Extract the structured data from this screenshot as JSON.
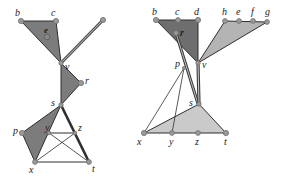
{
  "colors": {
    "dark_fill": "#7c7c7c",
    "light_fill": "#b4b4b4",
    "lighter_fill": "#cacaca",
    "edge": "#2e2e2e",
    "node": "#9a9a9a"
  },
  "left_diagram": {
    "labels": {
      "b": "b",
      "c": "c",
      "e": "e",
      "v": "v",
      "r": "r",
      "s": "s",
      "p": "p",
      "y": "y",
      "z": "z",
      "x": "x",
      "t": "t"
    }
  },
  "right_diagram": {
    "labels": {
      "b": "b",
      "c": "c",
      "d": "d",
      "h": "h",
      "e": "e",
      "f": "f",
      "g": "g",
      "r": "r",
      "p": "p",
      "v": "v",
      "s": "s",
      "x": "x",
      "y": "y",
      "z": "z",
      "t": "t"
    }
  }
}
